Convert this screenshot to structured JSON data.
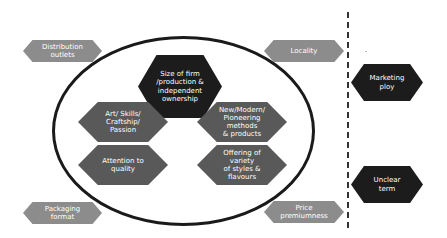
{
  "diagram": {
    "colors": {
      "dark": "#1c1c1c",
      "mid": "#595959",
      "light": "#8c8c8c",
      "ellipse_stroke": "#1a1a1a",
      "divider": "#333333",
      "text": "#ffffff"
    },
    "inner": {
      "center": "Size of firm\n/production &\nindependent\nownership",
      "left_top": "Art/ Skills/\nCraftship/ Passion",
      "left_bottom": "Attention to quality",
      "right_top": "New/Modern/\nPioneering methods\n& products",
      "right_bottom": "Offering of variety\nof styles & flavours"
    },
    "outer": {
      "top_left": "Distribution\noutlets",
      "top_right": "Locality",
      "bottom_left": "Packaging format",
      "bottom_right": "Price\npremiumness"
    },
    "excluded": {
      "top": "Marketing ploy",
      "bottom": "Unclear term"
    }
  }
}
